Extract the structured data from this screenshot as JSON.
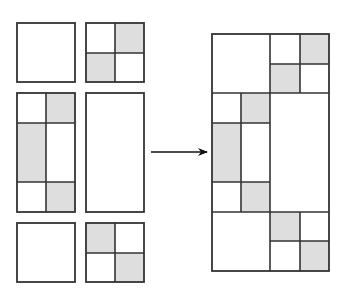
{
  "diagram": {
    "title": "",
    "colors": {
      "stroke": "#333333",
      "shade": "#dedede",
      "background": "#ffffff"
    },
    "tiles": [
      {
        "id": "tile-1",
        "label": "plain square",
        "x": 17,
        "y": 23,
        "w": 58,
        "h": 59,
        "cells": []
      },
      {
        "id": "tile-2",
        "label": "2x2 square, top-right and bottom-left shaded",
        "x": 86,
        "y": 23,
        "w": 58,
        "h": 59,
        "cells": [
          {
            "x": 115,
            "y": 23,
            "w": 29,
            "h": 30,
            "shaded": true
          },
          {
            "x": 86,
            "y": 53,
            "w": 29,
            "h": 29,
            "shaded": true
          }
        ],
        "lines": [
          {
            "x1": 115,
            "y1": 23,
            "x2": 115,
            "y2": 82
          },
          {
            "x1": 86,
            "y1": 53,
            "x2": 144,
            "y2": 53
          }
        ]
      },
      {
        "id": "tile-3",
        "label": "tall rectangle, split 2 columns x 3 rows",
        "x": 17,
        "y": 93,
        "w": 58,
        "h": 119,
        "cells": [
          {
            "x": 46,
            "y": 93,
            "w": 29,
            "h": 30,
            "shaded": true
          },
          {
            "x": 17,
            "y": 123,
            "w": 29,
            "h": 59,
            "shaded": true
          },
          {
            "x": 46,
            "y": 182,
            "w": 29,
            "h": 30,
            "shaded": true
          }
        ],
        "lines": [
          {
            "x1": 46,
            "y1": 93,
            "x2": 46,
            "y2": 212
          },
          {
            "x1": 17,
            "y1": 123,
            "x2": 75,
            "y2": 123
          },
          {
            "x1": 17,
            "y1": 182,
            "x2": 75,
            "y2": 182
          }
        ]
      },
      {
        "id": "tile-4",
        "label": "plain tall rectangle",
        "x": 86,
        "y": 93,
        "w": 58,
        "h": 119,
        "cells": []
      },
      {
        "id": "tile-5",
        "label": "plain square",
        "x": 17,
        "y": 223,
        "w": 58,
        "h": 59,
        "cells": []
      },
      {
        "id": "tile-6",
        "label": "2x2 square, top-left and bottom-right shaded",
        "x": 86,
        "y": 223,
        "w": 58,
        "h": 59,
        "cells": [
          {
            "x": 86,
            "y": 223,
            "w": 29,
            "h": 30,
            "shaded": true
          },
          {
            "x": 115,
            "y": 253,
            "w": 29,
            "h": 29,
            "shaded": true
          }
        ],
        "lines": [
          {
            "x1": 115,
            "y1": 223,
            "x2": 115,
            "y2": 282
          },
          {
            "x1": 86,
            "y1": 253,
            "x2": 144,
            "y2": 253
          }
        ]
      }
    ],
    "arrow": {
      "label": "transforms into",
      "x1": 151,
      "y1": 152,
      "x2": 207,
      "y2": 152
    },
    "composite": {
      "label": "assembled figure",
      "x": 212,
      "y": 34,
      "w": 117,
      "h": 237,
      "cells": [
        {
          "x": 300,
          "y": 34,
          "w": 29,
          "h": 30,
          "shaded": true
        },
        {
          "x": 270,
          "y": 64,
          "w": 30,
          "h": 29,
          "shaded": true
        },
        {
          "x": 241,
          "y": 93,
          "w": 29,
          "h": 30,
          "shaded": true
        },
        {
          "x": 212,
          "y": 123,
          "w": 29,
          "h": 59,
          "shaded": true
        },
        {
          "x": 241,
          "y": 182,
          "w": 29,
          "h": 30,
          "shaded": true
        },
        {
          "x": 270,
          "y": 212,
          "w": 30,
          "h": 29,
          "shaded": true
        },
        {
          "x": 300,
          "y": 241,
          "w": 29,
          "h": 30,
          "shaded": true
        }
      ],
      "lines": [
        {
          "x1": 212,
          "y1": 93,
          "x2": 329,
          "y2": 93
        },
        {
          "x1": 212,
          "y1": 212,
          "x2": 329,
          "y2": 212
        },
        {
          "x1": 270,
          "y1": 34,
          "x2": 270,
          "y2": 271
        },
        {
          "x1": 300,
          "y1": 34,
          "x2": 300,
          "y2": 93
        },
        {
          "x1": 270,
          "y1": 64,
          "x2": 329,
          "y2": 64
        },
        {
          "x1": 241,
          "y1": 93,
          "x2": 241,
          "y2": 212
        },
        {
          "x1": 212,
          "y1": 123,
          "x2": 270,
          "y2": 123
        },
        {
          "x1": 212,
          "y1": 182,
          "x2": 270,
          "y2": 182
        },
        {
          "x1": 300,
          "y1": 212,
          "x2": 300,
          "y2": 271
        },
        {
          "x1": 270,
          "y1": 241,
          "x2": 329,
          "y2": 241
        }
      ]
    }
  }
}
